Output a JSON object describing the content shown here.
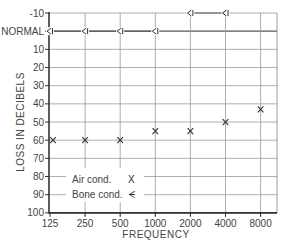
{
  "chart_data": {
    "type": "scatter",
    "title": "",
    "xlabel": "FREQUENCY",
    "ylabel": "LOSS IN DECIBELS",
    "x_scale": "log2",
    "categories": [
      "125",
      "250",
      "500",
      "1000",
      "2000",
      "4000",
      "8000"
    ],
    "y_ticks": [
      "-10",
      "NORMAL",
      "10",
      "20",
      "30",
      "40",
      "50",
      "60",
      "70",
      "80",
      "90",
      "100"
    ],
    "y_tick_values": [
      -10,
      0,
      10,
      20,
      30,
      40,
      50,
      60,
      70,
      80,
      90,
      100
    ],
    "ylim": [
      -10,
      100
    ],
    "y_inverted": true,
    "grid": true,
    "series": [
      {
        "name": "Air cond.",
        "marker": "X",
        "connected": false,
        "values": [
          60,
          60,
          60,
          55,
          55,
          50,
          43
        ]
      },
      {
        "name": "Bone cond.",
        "marker": "<",
        "connected": true,
        "values": [
          0,
          0,
          0,
          0,
          -10,
          -10,
          null
        ],
        "segments": [
          [
            0,
            3
          ],
          [
            4,
            5
          ]
        ]
      }
    ],
    "legend": {
      "position": "lower-left inside",
      "entries": [
        {
          "label": "Air cond.",
          "symbol": "X"
        },
        {
          "label": "Bone cond.",
          "symbol": "ᗕ"
        }
      ]
    }
  },
  "legend": {
    "air_label": "Air cond.",
    "air_symbol": "X",
    "bone_label": "Bone cond.",
    "bone_symbol": "ᗕ"
  },
  "axes": {
    "x_label": "FREQUENCY",
    "y_label": "LOSS IN DECIBELS"
  }
}
